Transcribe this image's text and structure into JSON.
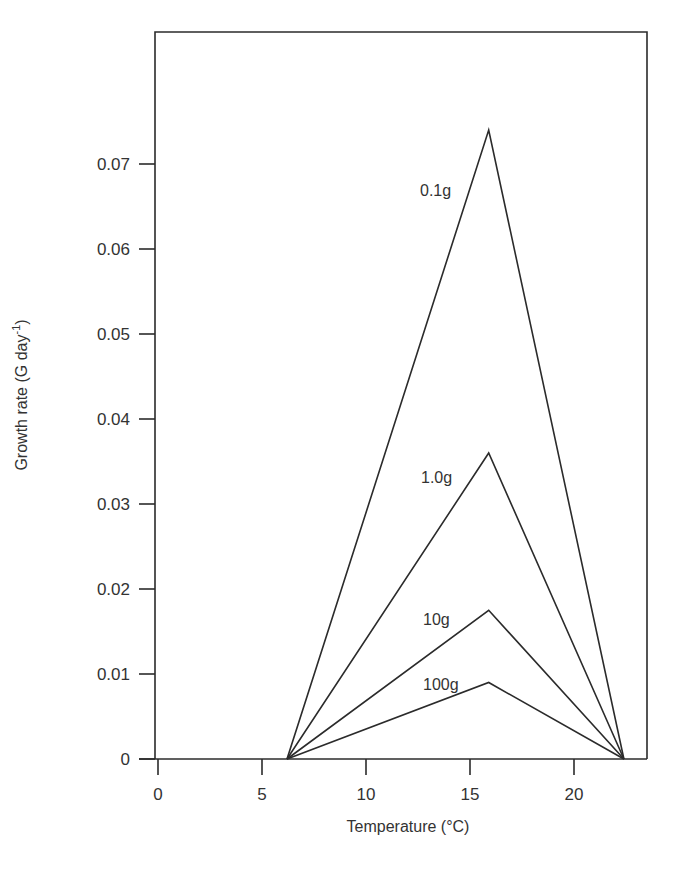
{
  "chart_data": {
    "type": "line",
    "title": "",
    "xlabel": "Temperature (°C)",
    "ylabel": "Growth rate (G day⁻¹)",
    "xlim": [
      0,
      23.5
    ],
    "ylim": [
      0,
      0.08
    ],
    "x_ticks": [
      0,
      5,
      10,
      15,
      20
    ],
    "x_tick_labels": [
      "0",
      "5",
      "10",
      "15",
      "20"
    ],
    "y_ticks": [
      0,
      0.01,
      0.02,
      0.03,
      0.04,
      0.05,
      0.06,
      0.07
    ],
    "y_tick_labels": [
      "0",
      "0.01",
      "0.02",
      "0.03",
      "0.04",
      "0.05",
      "0.06",
      "0.07"
    ],
    "grid": false,
    "legend": "inline labels",
    "series": [
      {
        "name": "0.1g",
        "x": [
          6.2,
          15.9,
          22.4
        ],
        "values": [
          0,
          0.074,
          0
        ]
      },
      {
        "name": "1.0g",
        "x": [
          6.2,
          15.9,
          22.4
        ],
        "values": [
          0,
          0.036,
          0
        ]
      },
      {
        "name": "10g",
        "x": [
          6.2,
          15.9,
          22.4
        ],
        "values": [
          0,
          0.0175,
          0
        ]
      },
      {
        "name": "100g",
        "x": [
          6.2,
          15.9,
          22.4
        ],
        "values": [
          0,
          0.009,
          0
        ]
      }
    ],
    "line_color": "#2b2b2b",
    "text_color": "#333333"
  }
}
